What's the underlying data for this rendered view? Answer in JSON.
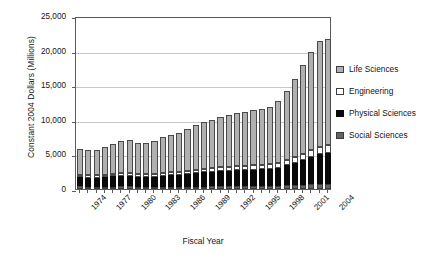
{
  "chart_data": {
    "type": "bar",
    "subtype": "stacked-vertical",
    "title": "",
    "xlabel": "Fiscal Year",
    "ylabel": "Constant 2004 Dollars (Millions)",
    "ylim": [
      0,
      25000
    ],
    "ytick_values": [
      0,
      5000,
      10000,
      15000,
      20000,
      25000
    ],
    "ytick_labels": [
      "0",
      "5,000",
      "10,000",
      "15,000",
      "20,000",
      "25,000"
    ],
    "grid": "horizontal",
    "legend_position": "right",
    "categories": [
      "1974",
      "1975",
      "1976",
      "1977",
      "1978",
      "1979",
      "1980",
      "1981",
      "1982",
      "1983",
      "1984",
      "1985",
      "1986",
      "1987",
      "1988",
      "1989",
      "1990",
      "1991",
      "1992",
      "1993",
      "1994",
      "1995",
      "1996",
      "1997",
      "1998",
      "1999",
      "2000",
      "2001",
      "2002",
      "2003",
      "2004"
    ],
    "xtick_labels_shown": [
      "1974",
      "1977",
      "1980",
      "1983",
      "1986",
      "1989",
      "1992",
      "1995",
      "1998",
      "2001",
      "2004"
    ],
    "stack_order_bottom_to_top": [
      "Social Sciences",
      "Physical Sciences",
      "Engineering",
      "Life Sciences"
    ],
    "series": [
      {
        "name": "Social Sciences",
        "color": "#636363",
        "values": [
          380,
          360,
          350,
          360,
          360,
          370,
          370,
          330,
          300,
          300,
          310,
          320,
          330,
          330,
          350,
          360,
          370,
          380,
          390,
          400,
          410,
          420,
          430,
          440,
          470,
          520,
          570,
          620,
          680,
          720,
          760
        ]
      },
      {
        "name": "Physical Sciences",
        "color": "#0a0a0a",
        "values": [
          1320,
          1290,
          1300,
          1390,
          1450,
          1510,
          1530,
          1470,
          1450,
          1500,
          1620,
          1680,
          1720,
          1830,
          1950,
          2030,
          2090,
          2180,
          2250,
          2300,
          2350,
          2400,
          2420,
          2480,
          2620,
          2880,
          3180,
          3560,
          3950,
          4280,
          4380
        ]
      },
      {
        "name": "Engineering",
        "color": "#ffffff",
        "values": [
          330,
          320,
          320,
          340,
          360,
          380,
          390,
          380,
          380,
          400,
          430,
          450,
          470,
          500,
          520,
          540,
          560,
          580,
          600,
          610,
          620,
          630,
          640,
          660,
          700,
          770,
          850,
          950,
          1050,
          1130,
          1160
        ]
      },
      {
        "name": "Life Sciences",
        "color": "#b0b0b0",
        "values": [
          3820,
          3680,
          3700,
          4030,
          4390,
          4740,
          4820,
          4530,
          4470,
          4700,
          5140,
          5400,
          5560,
          5990,
          6430,
          6700,
          6970,
          7230,
          7450,
          7630,
          7780,
          7910,
          8030,
          8340,
          8930,
          10010,
          11260,
          12730,
          14080,
          15320,
          15410
        ]
      }
    ],
    "totals": [
      5850,
      5650,
      5670,
      6120,
      6560,
      7000,
      7110,
      6710,
      6600,
      6900,
      7500,
      7850,
      8080,
      8650,
      9250,
      9630,
      9990,
      10370,
      10690,
      10940,
      11160,
      11360,
      11520,
      11920,
      12720,
      14180,
      15860,
      17860,
      19760,
      21450,
      21710
    ]
  },
  "legend": {
    "items": [
      {
        "label": "Life Sciences",
        "swatch": "life-sciences-swatch"
      },
      {
        "label": "Engineering",
        "swatch": "engineering-swatch"
      },
      {
        "label": "Physical Sciences",
        "swatch": "physical-sciences-swatch"
      },
      {
        "label": "Social Sciences",
        "swatch": "social-sciences-swatch"
      }
    ]
  }
}
